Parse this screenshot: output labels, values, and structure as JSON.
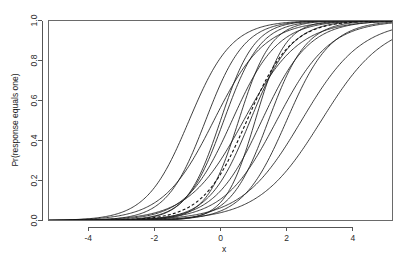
{
  "figure": {
    "width": 406,
    "height": 272,
    "background_color": "#ffffff",
    "curve_color": "#1c1c1c",
    "axis_color": "#555555"
  },
  "chart_data": {
    "type": "line",
    "title": "",
    "subtitle": "",
    "xlabel": "x",
    "ylabel": "Pr(response equals one)",
    "xlim": [
      -5.2,
      5.2
    ],
    "ylim": [
      0.0,
      1.0
    ],
    "xticks": [
      -4,
      -2,
      0,
      2,
      4
    ],
    "xtick_labels": [
      "-4",
      "-2",
      "0",
      "2",
      "4"
    ],
    "yticks": [
      0.0,
      0.2,
      0.4,
      0.6,
      0.8,
      1.0
    ],
    "ytick_labels": [
      "0.0",
      "0.2",
      "0.4",
      "0.6",
      "0.8",
      "1.0"
    ],
    "grid": false,
    "legend": false,
    "legend_position": "none",
    "x_sample": [
      -5.2,
      -4.8,
      -4.4,
      -4.0,
      -3.6,
      -3.2,
      -2.8,
      -2.4,
      -2.0,
      -1.6,
      -1.2,
      -0.8,
      -0.4,
      0.0,
      0.4,
      0.8,
      1.2,
      1.6,
      2.0,
      2.4,
      2.8,
      3.2,
      3.6,
      4.0,
      4.4,
      4.8,
      5.2
    ],
    "curve_family": "logistic",
    "curve_formula": "y = 1 / (1 + exp(-slope * (x - midpoint)))",
    "series": [
      {
        "name": "curve-01",
        "midpoint": -0.95,
        "slope": 1.55,
        "style": "solid",
        "linewidth": 0.85
      },
      {
        "name": "curve-02",
        "midpoint": -0.45,
        "slope": 1.7,
        "style": "solid",
        "linewidth": 0.85
      },
      {
        "name": "curve-03",
        "midpoint": -0.2,
        "slope": 1.3,
        "style": "solid",
        "linewidth": 0.85
      },
      {
        "name": "curve-04",
        "midpoint": 0.0,
        "slope": 1.95,
        "style": "solid",
        "linewidth": 1.35
      },
      {
        "name": "curve-05",
        "midpoint": 0.1,
        "slope": 1.8,
        "style": "solid",
        "linewidth": 1.25
      },
      {
        "name": "curve-06",
        "midpoint": 0.35,
        "slope": 1.45,
        "style": "solid",
        "linewidth": 0.85
      },
      {
        "name": "curve-07",
        "midpoint": 0.55,
        "slope": 2.05,
        "style": "solid",
        "linewidth": 0.85
      },
      {
        "name": "curve-08",
        "midpoint": 0.7,
        "slope": 1.2,
        "style": "solid",
        "linewidth": 0.85
      },
      {
        "name": "curve-09",
        "midpoint": 0.9,
        "slope": 1.6,
        "style": "solid",
        "linewidth": 0.85
      },
      {
        "name": "curve-10",
        "midpoint": 1.05,
        "slope": 2.2,
        "style": "solid",
        "linewidth": 0.85
      },
      {
        "name": "curve-11",
        "midpoint": 1.25,
        "slope": 1.4,
        "style": "solid",
        "linewidth": 0.85
      },
      {
        "name": "curve-12",
        "midpoint": 1.45,
        "slope": 1.75,
        "style": "solid",
        "linewidth": 0.85
      },
      {
        "name": "curve-13",
        "midpoint": 1.7,
        "slope": 1.25,
        "style": "solid",
        "linewidth": 0.85
      },
      {
        "name": "curve-14",
        "midpoint": 2.0,
        "slope": 1.5,
        "style": "solid",
        "linewidth": 0.85
      },
      {
        "name": "curve-15",
        "midpoint": 2.45,
        "slope": 1.1,
        "style": "solid",
        "linewidth": 0.85
      },
      {
        "name": "curve-16",
        "midpoint": 3.05,
        "slope": 1.05,
        "style": "solid",
        "linewidth": 0.85
      },
      {
        "name": "curve-average",
        "midpoint": 0.8,
        "slope": 1.5,
        "style": "dashed",
        "linewidth": 1.1
      }
    ]
  }
}
